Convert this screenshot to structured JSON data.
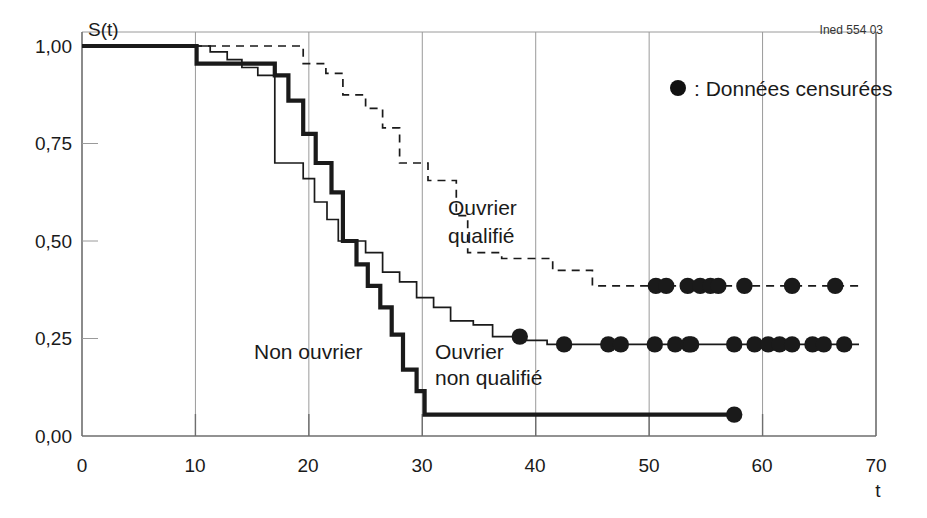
{
  "credit": "Ined 554 03",
  "axes": {
    "y_axis_name": "S(t)",
    "x_axis_name": "t",
    "y_ticks": [
      "0,00",
      "0,25",
      "0,50",
      "0,75",
      "1,00"
    ],
    "x_ticks": [
      "0",
      "10",
      "20",
      "30",
      "40",
      "50",
      "60",
      "70"
    ]
  },
  "legend": {
    "marker": "filled-circle",
    "text": ": Données censurées"
  },
  "curve_labels": {
    "qualified": "Ouvrier\nqualifié",
    "qualified_line1": "Ouvrier",
    "qualified_line2": "qualifié",
    "non_worker": "Non ouvrier",
    "unqualified_line1": "Ouvrier",
    "unqualified_line2": "non qualifié"
  },
  "colors": {
    "ink": "#1a1a1a",
    "axis": "#6e6e6e",
    "grid": "#9a9a9a",
    "background": "#ffffff"
  },
  "chart_data": {
    "type": "line",
    "title": "",
    "subtitle": "",
    "xlabel": "t",
    "ylabel": "S(t)",
    "xlim": [
      0,
      70
    ],
    "ylim": [
      0.0,
      1.0
    ],
    "grid": "vertical-only",
    "legend_position": "top-right",
    "annotations": [
      {
        "text": "Ouvrier qualifié",
        "x": 40,
        "y": 0.6
      },
      {
        "text": "Non ouvrier",
        "x": 20,
        "y": 0.255
      },
      {
        "text": "Ouvrier non qualifié",
        "x": 37,
        "y": 0.245
      },
      {
        "text": "● : Données censurées",
        "x": 58,
        "y": 0.9
      },
      {
        "text": "Ined 554 03",
        "x": 68,
        "y": 1.03
      }
    ],
    "series": [
      {
        "name": "Ouvrier qualifié",
        "style": "dashed",
        "width": 2,
        "steps": [
          [
            0,
            1.0
          ],
          [
            19.5,
            1.0
          ],
          [
            19.5,
            0.955
          ],
          [
            21.5,
            0.955
          ],
          [
            21.5,
            0.93
          ],
          [
            23.0,
            0.93
          ],
          [
            23.0,
            0.875
          ],
          [
            25.0,
            0.875
          ],
          [
            25.0,
            0.84
          ],
          [
            26.5,
            0.84
          ],
          [
            26.5,
            0.79
          ],
          [
            28.0,
            0.79
          ],
          [
            28.0,
            0.7
          ],
          [
            30.5,
            0.7
          ],
          [
            30.5,
            0.655
          ],
          [
            33.0,
            0.655
          ],
          [
            33.0,
            0.565
          ],
          [
            34.0,
            0.565
          ],
          [
            34.0,
            0.47
          ],
          [
            37.0,
            0.47
          ],
          [
            37.0,
            0.455
          ],
          [
            41.5,
            0.455
          ],
          [
            41.5,
            0.425
          ],
          [
            45.0,
            0.425
          ],
          [
            45.0,
            0.385
          ],
          [
            68.5,
            0.385
          ]
        ],
        "censored_points": [
          [
            50.6,
            0.385
          ],
          [
            51.5,
            0.385
          ],
          [
            53.4,
            0.385
          ],
          [
            54.5,
            0.385
          ],
          [
            55.4,
            0.385
          ],
          [
            56.1,
            0.385
          ],
          [
            58.4,
            0.385
          ],
          [
            62.6,
            0.385
          ],
          [
            66.4,
            0.385
          ]
        ]
      },
      {
        "name": "Ouvrier non qualifié",
        "style": "solid-thin",
        "width": 2,
        "steps": [
          [
            0,
            1.0
          ],
          [
            11.3,
            1.0
          ],
          [
            11.3,
            0.985
          ],
          [
            12.8,
            0.985
          ],
          [
            12.8,
            0.965
          ],
          [
            14.1,
            0.965
          ],
          [
            14.1,
            0.945
          ],
          [
            15.5,
            0.945
          ],
          [
            15.5,
            0.925
          ],
          [
            17.0,
            0.925
          ],
          [
            17.0,
            0.7
          ],
          [
            19.5,
            0.7
          ],
          [
            19.5,
            0.66
          ],
          [
            20.5,
            0.66
          ],
          [
            20.5,
            0.6
          ],
          [
            21.6,
            0.6
          ],
          [
            21.6,
            0.555
          ],
          [
            22.6,
            0.555
          ],
          [
            22.6,
            0.5
          ],
          [
            25.0,
            0.5
          ],
          [
            25.0,
            0.47
          ],
          [
            26.5,
            0.47
          ],
          [
            26.5,
            0.42
          ],
          [
            28.0,
            0.42
          ],
          [
            28.0,
            0.395
          ],
          [
            29.5,
            0.395
          ],
          [
            29.5,
            0.355
          ],
          [
            31.0,
            0.355
          ],
          [
            31.0,
            0.33
          ],
          [
            32.5,
            0.33
          ],
          [
            32.5,
            0.295
          ],
          [
            34.5,
            0.295
          ],
          [
            34.5,
            0.285
          ],
          [
            36.2,
            0.285
          ],
          [
            36.2,
            0.255
          ],
          [
            38.6,
            0.255
          ],
          [
            38.6,
            0.245
          ],
          [
            41.0,
            0.245
          ],
          [
            41.0,
            0.235
          ],
          [
            68.5,
            0.235
          ]
        ],
        "censored_points": [
          [
            38.6,
            0.255
          ],
          [
            42.5,
            0.235
          ],
          [
            46.4,
            0.235
          ],
          [
            47.5,
            0.235
          ],
          [
            50.5,
            0.235
          ],
          [
            52.3,
            0.235
          ],
          [
            53.5,
            0.235
          ],
          [
            53.7,
            0.235
          ],
          [
            57.5,
            0.235
          ],
          [
            59.3,
            0.235
          ],
          [
            60.5,
            0.235
          ],
          [
            61.5,
            0.235
          ],
          [
            62.6,
            0.235
          ],
          [
            64.4,
            0.235
          ],
          [
            65.4,
            0.235
          ],
          [
            67.2,
            0.235
          ]
        ]
      },
      {
        "name": "Non ouvrier",
        "style": "solid-thick",
        "width": 4,
        "steps": [
          [
            0,
            1.0
          ],
          [
            10.1,
            1.0
          ],
          [
            10.1,
            0.955
          ],
          [
            17.0,
            0.955
          ],
          [
            17.0,
            0.925
          ],
          [
            18.2,
            0.925
          ],
          [
            18.2,
            0.86
          ],
          [
            19.5,
            0.86
          ],
          [
            19.5,
            0.775
          ],
          [
            20.6,
            0.775
          ],
          [
            20.6,
            0.7
          ],
          [
            22.0,
            0.7
          ],
          [
            22.0,
            0.625
          ],
          [
            23.0,
            0.625
          ],
          [
            23.0,
            0.5
          ],
          [
            24.2,
            0.5
          ],
          [
            24.2,
            0.44
          ],
          [
            25.2,
            0.44
          ],
          [
            25.2,
            0.385
          ],
          [
            26.3,
            0.385
          ],
          [
            26.3,
            0.33
          ],
          [
            27.3,
            0.33
          ],
          [
            27.3,
            0.26
          ],
          [
            28.3,
            0.26
          ],
          [
            28.3,
            0.17
          ],
          [
            29.5,
            0.17
          ],
          [
            29.5,
            0.115
          ],
          [
            30.2,
            0.115
          ],
          [
            30.2,
            0.055
          ],
          [
            57.5,
            0.055
          ]
        ],
        "censored_points": [
          [
            57.5,
            0.055
          ]
        ]
      }
    ]
  }
}
